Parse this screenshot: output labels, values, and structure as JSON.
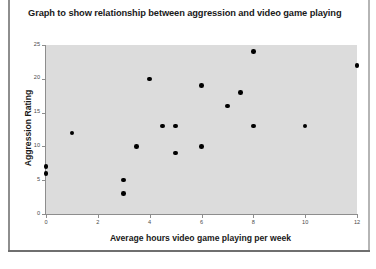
{
  "chart_data": {
    "type": "scatter",
    "title": "Graph to show relationship between aggression and video game playing",
    "xlabel": "Average hours video game playing per week",
    "ylabel": "Aggression Rating",
    "xlim": [
      0,
      12
    ],
    "ylim": [
      0,
      25
    ],
    "xticks": [
      0,
      2,
      4,
      6,
      8,
      10,
      12
    ],
    "yticks": [
      0,
      5,
      10,
      15,
      20,
      25
    ],
    "grid": false,
    "legend": false,
    "point_color": "#000000",
    "plot_background": "#dcdcdc",
    "points": [
      {
        "x": 0,
        "y": 7
      },
      {
        "x": 0,
        "y": 6
      },
      {
        "x": 1,
        "y": 12
      },
      {
        "x": 3,
        "y": 3
      },
      {
        "x": 3,
        "y": 5
      },
      {
        "x": 3.5,
        "y": 10
      },
      {
        "x": 4,
        "y": 20
      },
      {
        "x": 4.5,
        "y": 13
      },
      {
        "x": 5,
        "y": 13
      },
      {
        "x": 5,
        "y": 9
      },
      {
        "x": 6,
        "y": 19
      },
      {
        "x": 6,
        "y": 10
      },
      {
        "x": 7,
        "y": 16
      },
      {
        "x": 7.5,
        "y": 18
      },
      {
        "x": 8,
        "y": 24
      },
      {
        "x": 8,
        "y": 13
      },
      {
        "x": 10,
        "y": 13
      },
      {
        "x": 12,
        "y": 22
      }
    ]
  }
}
